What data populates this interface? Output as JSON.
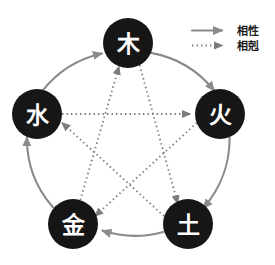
{
  "figure": {
    "background_color": "#ffffff",
    "center": {
      "x": 128,
      "y": 148
    },
    "radius": 105
  },
  "style": {
    "node_fill": "#161616",
    "node_text_color": "#ffffff",
    "sheng_stroke": "#8a8a8a",
    "ke_stroke": "#7d7d7d",
    "legend_text_color": "#1a1a1a"
  },
  "nodes": [
    {
      "id": "wood",
      "label": "木",
      "x": 128,
      "y": 43,
      "r": 25
    },
    {
      "id": "fire",
      "label": "火",
      "x": 220,
      "y": 114,
      "r": 25
    },
    {
      "id": "earth",
      "label": "土",
      "x": 188,
      "y": 224,
      "r": 25
    },
    {
      "id": "metal",
      "label": "金",
      "x": 73,
      "y": 224,
      "r": 25
    },
    {
      "id": "water",
      "label": "水",
      "x": 37,
      "y": 114,
      "r": 25
    }
  ],
  "sheng_cycle": [
    {
      "from": "wood",
      "to": "fire"
    },
    {
      "from": "fire",
      "to": "earth"
    },
    {
      "from": "earth",
      "to": "metal"
    },
    {
      "from": "metal",
      "to": "water"
    },
    {
      "from": "water",
      "to": "wood"
    }
  ],
  "ke_cycle": [
    {
      "from": "wood",
      "to": "earth"
    },
    {
      "from": "earth",
      "to": "water"
    },
    {
      "from": "water",
      "to": "fire"
    },
    {
      "from": "fire",
      "to": "metal"
    },
    {
      "from": "metal",
      "to": "wood"
    }
  ],
  "legend": {
    "items": [
      {
        "id": "sheng",
        "label": "相性",
        "arrow_style": "solid"
      },
      {
        "id": "ke",
        "label": "相剋",
        "arrow_style": "dotted"
      }
    ]
  }
}
